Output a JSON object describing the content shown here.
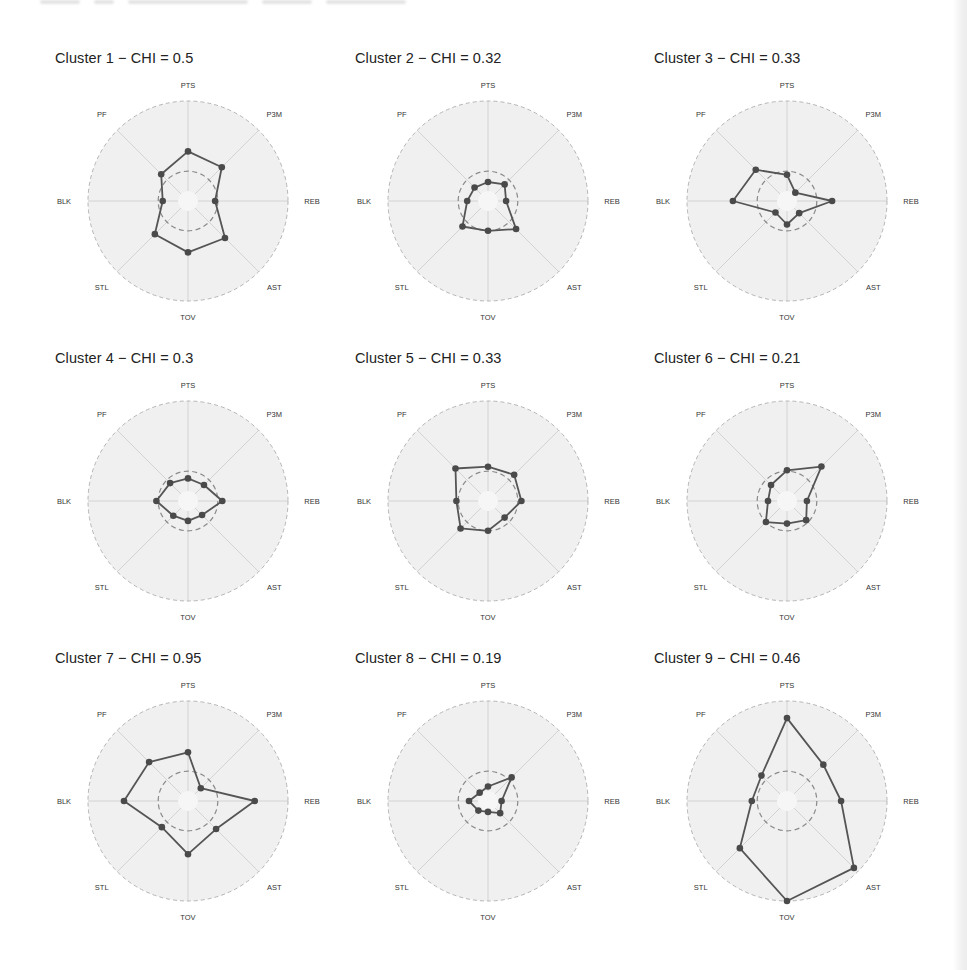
{
  "figure": {
    "top_cut_text_visible": false
  },
  "colors": {
    "line": "#555555",
    "point": "#4a4a4a",
    "panel_fill": "#f0f0f0",
    "axis_line": "#cfcfcf",
    "outer_ring": "#b5b5b5",
    "mid_ring": "#8a8a8a"
  },
  "chart_data": [
    {
      "type": "radar",
      "title": "Cluster 1 − CHI = 0.5",
      "axes": [
        "PTS",
        "P3M",
        "REB",
        "AST",
        "TOV",
        "STL",
        "BLK",
        "PF"
      ],
      "values": [
        0.44,
        0.42,
        0.19,
        0.47,
        0.46,
        0.41,
        0.17,
        0.31
      ],
      "range": [
        0,
        1
      ],
      "mid_ring": 0.22
    },
    {
      "type": "radar",
      "title": "Cluster 2 − CHI = 0.32",
      "axes": [
        "PTS",
        "P3M",
        "REB",
        "AST",
        "TOV",
        "STL",
        "BLK",
        "PF"
      ],
      "values": [
        0.1,
        0.15,
        0.09,
        0.33,
        0.22,
        0.29,
        0.12,
        0.1
      ],
      "range": [
        0,
        1
      ],
      "mid_ring": 0.22
    },
    {
      "type": "radar",
      "title": "Cluster 3 − CHI = 0.33",
      "axes": [
        "PTS",
        "P3M",
        "REB",
        "AST",
        "TOV",
        "STL",
        "BLK",
        "PF"
      ],
      "values": [
        0.18,
        0.02,
        0.39,
        0.08,
        0.15,
        0.07,
        0.49,
        0.38
      ],
      "range": [
        0,
        1
      ],
      "mid_ring": 0.22
    },
    {
      "type": "radar",
      "title": "Cluster 4 − CHI = 0.3",
      "axes": [
        "PTS",
        "P3M",
        "REB",
        "AST",
        "TOV",
        "STL",
        "BLK",
        "PF"
      ],
      "values": [
        0.14,
        0.14,
        0.27,
        0.11,
        0.11,
        0.12,
        0.24,
        0.17
      ],
      "range": [
        0,
        1
      ],
      "mid_ring": 0.22
    },
    {
      "type": "radar",
      "title": "Cluster 5 − CHI = 0.33",
      "axes": [
        "PTS",
        "P3M",
        "REB",
        "AST",
        "TOV",
        "STL",
        "BLK",
        "PF"
      ],
      "values": [
        0.27,
        0.3,
        0.26,
        0.15,
        0.22,
        0.32,
        0.24,
        0.4
      ],
      "range": [
        0,
        1
      ],
      "mid_ring": 0.22
    },
    {
      "type": "radar",
      "title": "Cluster 6 − CHI = 0.21",
      "axes": [
        "PTS",
        "P3M",
        "REB",
        "AST",
        "TOV",
        "STL",
        "BLK",
        "PF"
      ],
      "values": [
        0.23,
        0.43,
        0.11,
        0.19,
        0.14,
        0.22,
        0.1,
        0.14
      ],
      "range": [
        0,
        1
      ],
      "mid_ring": 0.22
    },
    {
      "type": "radar",
      "title": "Cluster 7 − CHI = 0.95",
      "axes": [
        "PTS",
        "P3M",
        "REB",
        "AST",
        "TOV",
        "STL",
        "BLK",
        "PF"
      ],
      "values": [
        0.43,
        0.09,
        0.63,
        0.33,
        0.48,
        0.3,
        0.6,
        0.5
      ],
      "range": [
        0,
        1
      ],
      "mid_ring": 0.22
    },
    {
      "type": "radar",
      "title": "Cluster 8 − CHI = 0.19",
      "axes": [
        "PTS",
        "P3M",
        "REB",
        "AST",
        "TOV",
        "STL",
        "BLK",
        "PF"
      ],
      "values": [
        0.05,
        0.26,
        0.04,
        0.08,
        0.01,
        0.04,
        0.1,
        0.02
      ],
      "range": [
        0,
        1
      ],
      "mid_ring": 0.22
    },
    {
      "type": "radar",
      "title": "Cluster 9 − CHI = 0.46",
      "axes": [
        "PTS",
        "P3M",
        "REB",
        "AST",
        "TOV",
        "STL",
        "BLK",
        "PF"
      ],
      "values": [
        0.81,
        0.46,
        0.49,
        0.94,
        1.0,
        0.63,
        0.28,
        0.29
      ],
      "range": [
        0,
        1
      ],
      "mid_ring": 0.22
    }
  ]
}
